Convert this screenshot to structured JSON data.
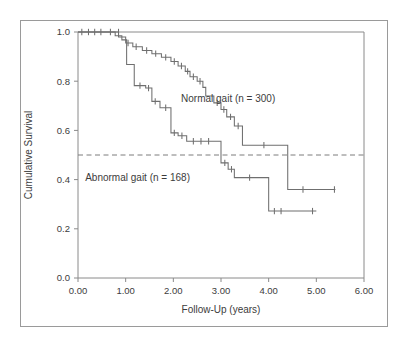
{
  "figure": {
    "background_color": "#ffffff",
    "border_color": "#9a9a9a",
    "line_color": "#6f6f6f",
    "text_color": "#3c3c3c"
  },
  "chart_data": {
    "type": "line",
    "subtype": "kaplan-meier-step",
    "title": "",
    "xlabel": "Follow-Up (years)",
    "ylabel": "Cumulative Survival",
    "xlim": [
      0.0,
      6.0
    ],
    "ylim": [
      0.0,
      1.0
    ],
    "xticks": [
      0.0,
      1.0,
      2.0,
      3.0,
      4.0,
      5.0,
      6.0
    ],
    "xticklabels": [
      "0.00",
      "1.00",
      "2.00",
      "3.00",
      "4.00",
      "5.00",
      "6.00"
    ],
    "yticks": [
      0.0,
      0.2,
      0.4,
      0.6,
      0.8,
      1.0
    ],
    "yticklabels": [
      "0.0",
      "0.2",
      "0.4",
      "0.6",
      "0.8",
      "1.0"
    ],
    "grid": false,
    "legend_position": "inline-annotation",
    "reference_lines": [
      {
        "name": "median-survival-reference",
        "orientation": "horizontal",
        "y": 0.5,
        "style": "dashed"
      }
    ],
    "annotations": [
      {
        "name": "normal-gait-label",
        "text": "Normal gait (n = 300)",
        "x": 3.15,
        "y": 0.715
      },
      {
        "name": "abnormal-gait-label",
        "text": "Abnormal gait (n = 168)",
        "x": 1.25,
        "y": 0.395
      }
    ],
    "series": [
      {
        "name": "Normal gait (n = 300)",
        "n": 300,
        "label": "Normal gait (n = 300)",
        "points": [
          [
            0.0,
            1.0
          ],
          [
            0.85,
            1.0
          ],
          [
            0.85,
            0.98
          ],
          [
            1.0,
            0.98
          ],
          [
            1.0,
            0.955
          ],
          [
            1.15,
            0.955
          ],
          [
            1.15,
            0.94
          ],
          [
            1.35,
            0.94
          ],
          [
            1.35,
            0.925
          ],
          [
            1.55,
            0.925
          ],
          [
            1.55,
            0.912
          ],
          [
            1.75,
            0.912
          ],
          [
            1.75,
            0.897
          ],
          [
            1.95,
            0.897
          ],
          [
            1.95,
            0.88
          ],
          [
            2.1,
            0.88
          ],
          [
            2.1,
            0.862
          ],
          [
            2.25,
            0.862
          ],
          [
            2.25,
            0.84
          ],
          [
            2.35,
            0.84
          ],
          [
            2.35,
            0.818
          ],
          [
            2.5,
            0.818
          ],
          [
            2.5,
            0.8
          ],
          [
            2.62,
            0.8
          ],
          [
            2.62,
            0.775
          ],
          [
            2.68,
            0.775
          ],
          [
            2.68,
            0.74
          ],
          [
            2.85,
            0.74
          ],
          [
            2.85,
            0.712
          ],
          [
            3.0,
            0.712
          ],
          [
            3.0,
            0.685
          ],
          [
            3.12,
            0.685
          ],
          [
            3.12,
            0.655
          ],
          [
            3.28,
            0.655
          ],
          [
            3.28,
            0.618
          ],
          [
            3.45,
            0.618
          ],
          [
            3.45,
            0.54
          ],
          [
            4.4,
            0.54
          ],
          [
            4.4,
            0.36
          ],
          [
            5.4,
            0.36
          ]
        ],
        "censor_points": [
          [
            0.08,
            1.0
          ],
          [
            0.22,
            1.0
          ],
          [
            0.35,
            1.0
          ],
          [
            0.48,
            1.0
          ],
          [
            0.68,
            1.0
          ],
          [
            1.05,
            0.955
          ],
          [
            1.22,
            0.94
          ],
          [
            1.44,
            0.925
          ],
          [
            1.63,
            0.912
          ],
          [
            1.84,
            0.897
          ],
          [
            2.02,
            0.88
          ],
          [
            2.17,
            0.862
          ],
          [
            2.3,
            0.84
          ],
          [
            2.42,
            0.818
          ],
          [
            2.56,
            0.8
          ],
          [
            2.92,
            0.712
          ],
          [
            3.06,
            0.685
          ],
          [
            3.2,
            0.655
          ],
          [
            3.36,
            0.618
          ],
          [
            3.9,
            0.54
          ],
          [
            4.72,
            0.36
          ],
          [
            5.38,
            0.36
          ]
        ]
      },
      {
        "name": "Abnormal gait (n = 168)",
        "n": 168,
        "label": "Abnormal gait (n = 168)",
        "points": [
          [
            0.0,
            1.0
          ],
          [
            0.78,
            1.0
          ],
          [
            0.78,
            0.985
          ],
          [
            0.92,
            0.985
          ],
          [
            0.92,
            0.968
          ],
          [
            1.02,
            0.968
          ],
          [
            1.02,
            0.868
          ],
          [
            1.18,
            0.868
          ],
          [
            1.18,
            0.782
          ],
          [
            1.42,
            0.782
          ],
          [
            1.42,
            0.772
          ],
          [
            1.55,
            0.772
          ],
          [
            1.55,
            0.718
          ],
          [
            1.72,
            0.718
          ],
          [
            1.72,
            0.692
          ],
          [
            1.95,
            0.692
          ],
          [
            1.95,
            0.59
          ],
          [
            2.1,
            0.59
          ],
          [
            2.1,
            0.578
          ],
          [
            2.28,
            0.578
          ],
          [
            2.28,
            0.556
          ],
          [
            3.0,
            0.556
          ],
          [
            3.0,
            0.468
          ],
          [
            3.15,
            0.468
          ],
          [
            3.15,
            0.442
          ],
          [
            3.28,
            0.442
          ],
          [
            3.28,
            0.408
          ],
          [
            4.0,
            0.408
          ],
          [
            4.0,
            0.272
          ],
          [
            5.0,
            0.272
          ]
        ],
        "censor_points": [
          [
            0.85,
            1.0
          ],
          [
            1.3,
            0.782
          ],
          [
            1.48,
            0.772
          ],
          [
            1.62,
            0.718
          ],
          [
            1.84,
            0.692
          ],
          [
            2.02,
            0.59
          ],
          [
            2.18,
            0.578
          ],
          [
            2.42,
            0.556
          ],
          [
            2.58,
            0.556
          ],
          [
            2.74,
            0.556
          ],
          [
            3.08,
            0.468
          ],
          [
            3.22,
            0.442
          ],
          [
            3.6,
            0.408
          ],
          [
            4.12,
            0.272
          ],
          [
            4.26,
            0.272
          ],
          [
            4.92,
            0.272
          ]
        ]
      }
    ]
  }
}
